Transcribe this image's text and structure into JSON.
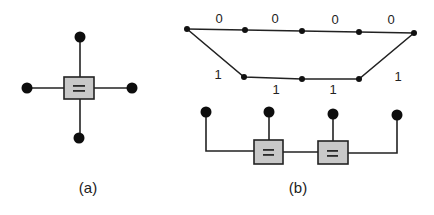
{
  "figure_a": {
    "caption": "(a)",
    "node_symbol": "=",
    "description": "equality constraint node with four attached variable nodes"
  },
  "figure_b": {
    "caption": "(b)",
    "node_symbols": [
      "=",
      "="
    ],
    "trellis": {
      "top_branch_labels": [
        "0",
        "0",
        "0",
        "0"
      ],
      "bottom_branch_labels": [
        "1",
        "1",
        "1",
        "1"
      ]
    },
    "description": "trellis with two paths above a chain of two equality constraint nodes connecting four variable nodes"
  },
  "colors": {
    "line": "#222222",
    "node_fill": "#0d0d0d",
    "box_fill": "#c8c8c8",
    "background": "#ffffff"
  }
}
